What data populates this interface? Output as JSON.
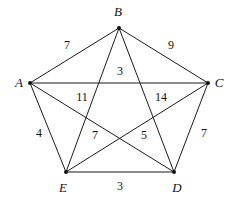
{
  "figure": {
    "kind": "weighted-complete-graph",
    "background_color": "#ffffff",
    "line_color": "#1b1b1b"
  },
  "chart_data": {
    "type": "diagram",
    "title": "",
    "xlabel": "",
    "ylabel": "",
    "graph_type": "complete graph K5 with edge weights",
    "nodes": [
      {
        "id": "A",
        "label": "A",
        "x": 30,
        "y": 83,
        "label_x": 19,
        "label_y": 82
      },
      {
        "id": "B",
        "label": "B",
        "x": 119,
        "y": 28,
        "label_x": 118,
        "label_y": 11
      },
      {
        "id": "C",
        "label": "C",
        "x": 208,
        "y": 83,
        "label_x": 219,
        "label_y": 82
      },
      {
        "id": "D",
        "label": "D",
        "x": 174,
        "y": 172,
        "label_x": 177,
        "label_y": 187
      },
      {
        "id": "E",
        "label": "E",
        "x": 66,
        "y": 172,
        "label_x": 63,
        "label_y": 187
      }
    ],
    "edges": [
      {
        "from": "A",
        "to": "B",
        "weight": "7",
        "label_x": 67,
        "label_y": 45
      },
      {
        "from": "B",
        "to": "C",
        "weight": "9",
        "label_x": 171,
        "label_y": 45
      },
      {
        "from": "A",
        "to": "C",
        "weight": "3",
        "label_x": 120,
        "label_y": 71
      },
      {
        "from": "A",
        "to": "D",
        "weight": "11",
        "label_x": 82,
        "label_y": 97
      },
      {
        "from": "C",
        "to": "E",
        "weight": "14",
        "label_x": 161,
        "label_y": 97
      },
      {
        "from": "A",
        "to": "E",
        "weight": "4",
        "label_x": 39,
        "label_y": 133
      },
      {
        "from": "C",
        "to": "D",
        "weight": "7",
        "label_x": 204,
        "label_y": 133
      },
      {
        "from": "B",
        "to": "E",
        "weight": "7",
        "label_x": 95,
        "label_y": 135
      },
      {
        "from": "B",
        "to": "D",
        "weight": "5",
        "label_x": 144,
        "label_y": 135
      },
      {
        "from": "E",
        "to": "D",
        "weight": "3",
        "label_x": 120,
        "label_y": 186
      }
    ]
  }
}
